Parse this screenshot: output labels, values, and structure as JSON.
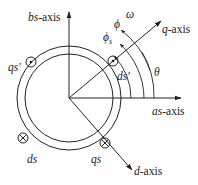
{
  "diagram": {
    "axes": {
      "bs": {
        "italic": "bs",
        "suffix": "-axis"
      },
      "as": {
        "italic": "as",
        "suffix": "-axis"
      },
      "q": {
        "italic": "q",
        "suffix": "-axis"
      },
      "d": {
        "italic": "d",
        "suffix": "-axis"
      }
    },
    "conductors": {
      "qs_prime": {
        "label": "qs′",
        "symbol": "dot"
      },
      "ds_prime": {
        "label": "ds′",
        "symbol": "dot"
      },
      "ds": {
        "label": "ds",
        "symbol": "cross"
      },
      "qs": {
        "label": "qs",
        "symbol": "cross"
      }
    },
    "angles": {
      "phi_s": {
        "main": "ϕ",
        "sub": "s"
      },
      "phi": {
        "main": "ϕ"
      },
      "omega": {
        "main": "ω"
      },
      "theta": {
        "main": "θ"
      }
    },
    "colors": {
      "ink": "#222222",
      "background": "#ffffff"
    }
  }
}
